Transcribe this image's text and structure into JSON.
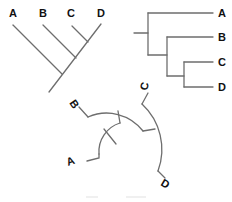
{
  "figure": {
    "colors": {
      "branch": "#6e6e6e",
      "label": "#111111",
      "background": "#ffffff"
    },
    "slanted_cladogram": {
      "taxa": [
        {
          "label": "A"
        },
        {
          "label": "B"
        },
        {
          "label": "C"
        },
        {
          "label": "D"
        }
      ]
    },
    "rectangular_tree": {
      "taxa": [
        {
          "label": "A"
        },
        {
          "label": "B"
        },
        {
          "label": "C"
        },
        {
          "label": "D"
        }
      ]
    },
    "circular_tree": {
      "taxa": [
        {
          "label": "A"
        },
        {
          "label": "B"
        },
        {
          "label": "C"
        },
        {
          "label": "D"
        }
      ]
    },
    "caption": ""
  }
}
